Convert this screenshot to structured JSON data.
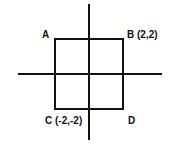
{
  "diagram": {
    "type": "coordinate-square",
    "colors": {
      "stroke": "#111111",
      "background": "#ffffff"
    },
    "axes": {
      "x": {
        "x1": 18,
        "x2": 162,
        "y": 74
      },
      "y": {
        "x": 89,
        "y1": 4,
        "y2": 140
      }
    },
    "square": {
      "x": 55,
      "y": 39,
      "width": 68,
      "height": 70
    },
    "points": [
      {
        "name": "A",
        "label": "A",
        "coords": null,
        "text_x": 42,
        "text_y": 38
      },
      {
        "name": "B",
        "label": "B (2,2)",
        "coords": [
          2,
          2
        ],
        "text_x": 127,
        "text_y": 38
      },
      {
        "name": "C",
        "label": "C (-2,-2)",
        "coords": [
          -2,
          -2
        ],
        "text_x": 45,
        "text_y": 124
      },
      {
        "name": "D",
        "label": "D",
        "coords": null,
        "text_x": 128,
        "text_y": 124
      }
    ]
  }
}
